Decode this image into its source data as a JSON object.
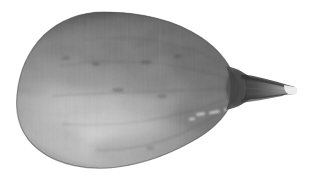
{
  "image": {
    "subject": "gourd",
    "caption": "Grayscale photograph of a pear-shaped gourd (winter squash) with a short tapering stem pointing to the right, isolated on a plain white background.",
    "orientation": "horizontal, stem to the right",
    "color_mode": "grayscale",
    "width": 317,
    "height": 181,
    "background_color": "#ffffff",
    "palette": {
      "background": "#ffffff",
      "body_mid": "#8d8d8d",
      "body_light": "#b6b6b6",
      "body_highlight": "#c9c9c9",
      "body_dark": "#5e5e5e",
      "body_shadow": "#4a4a4a",
      "outline": "#3c3c3c",
      "stem_dark": "#3a3a3a",
      "stem_light": "#d8d8d8",
      "stem_tip": "#efefef"
    },
    "regions": [
      {
        "name": "bulb",
        "label": "Round bulbous blossom end of the gourd",
        "center_x": 110,
        "center_y": 92,
        "radius_x": 92,
        "radius_y": 78,
        "tone": "#8d8d8d"
      },
      {
        "name": "neck",
        "label": "Tapering shoulder narrowing toward the stem",
        "center_x": 215,
        "center_y": 82,
        "tone": "#6e6e6e"
      },
      {
        "name": "stem",
        "label": "Short woody stem at the right tip",
        "start_x": 243,
        "end_x": 297,
        "center_y": 88,
        "tone": "#4a4a4a"
      },
      {
        "name": "lower-highlight",
        "label": "Broad pale specular highlight across the lower left belly",
        "center_x": 95,
        "center_y": 135,
        "tone": "#c2c2c2"
      },
      {
        "name": "upper-shadow",
        "label": "Darker shaded band along the top shoulder",
        "center_x": 120,
        "center_y": 35,
        "tone": "#6a6a6a"
      },
      {
        "name": "speckles",
        "label": "Small bright speckle marks near the lower right rim",
        "center_x": 212,
        "center_y": 116,
        "tone": "#d5d5d5"
      }
    ],
    "bounds": {
      "left": 18,
      "top": 12,
      "right": 297,
      "bottom": 168
    }
  }
}
